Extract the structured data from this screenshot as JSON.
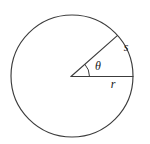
{
  "figure": {
    "type": "geometry-diagram",
    "background_color": "#ffffff",
    "stroke_color": "#3c3c3c",
    "label_color": "#1a1a1a",
    "circle": {
      "center_x": 72,
      "center_y": 76,
      "radius": 61
    },
    "radii": [
      {
        "name": "horizontal-radius",
        "angle_degrees": 0,
        "label": "r",
        "label_x": 113,
        "label_y": 87
      },
      {
        "name": "slanted-radius",
        "angle_degrees": 42,
        "label": "",
        "label_x": 0,
        "label_y": 0
      }
    ],
    "angle_arc": {
      "label": "θ",
      "label_x": 95,
      "label_y": 70,
      "arc_radius": 18,
      "from_degrees": 0,
      "to_degrees": 42
    },
    "circle_arc": {
      "label": "s",
      "label_x": 126,
      "label_y": 51,
      "from_degrees": 0,
      "to_degrees": 42
    },
    "labels": [
      {
        "text": "s",
        "name": "arc-length-label"
      },
      {
        "text": "θ",
        "name": "angle-theta-label"
      },
      {
        "text": "r",
        "name": "radius-label"
      }
    ]
  }
}
